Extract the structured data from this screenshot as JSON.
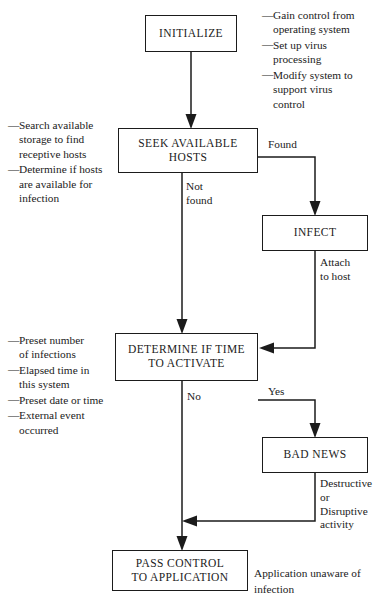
{
  "diagram": {
    "stroke_color": "#1b1b1b",
    "background_color": "#ffffff",
    "nodes": {
      "initialize": {
        "label": "INITIALIZE"
      },
      "seek": {
        "label": "SEEK AVAILABLE\nHOSTS"
      },
      "infect": {
        "label": "INFECT"
      },
      "determine": {
        "label": "DETERMINE IF TIME\nTO ACTIVATE"
      },
      "badnews": {
        "label": "BAD NEWS"
      },
      "passcontrol": {
        "label": "PASS CONTROL\nTO APPLICATION"
      }
    },
    "edge_labels": {
      "not_found": "Not\nfound",
      "found": "Found",
      "attach": "Attach\nto host",
      "no": "No",
      "yes": "Yes",
      "destructive": "Destructive\nor\nDisruptive\nactivity"
    },
    "notes": {
      "dash": "—",
      "initialize": {
        "items": [
          "Gain control from\noperating system",
          "Set up virus\nprocessing",
          "Modify system to\nsupport virus\ncontrol"
        ]
      },
      "seek": {
        "items": [
          "Search available\nstorage to find\nreceptive hosts",
          "Determine if hosts\nare available for\ninfection"
        ]
      },
      "determine": {
        "items": [
          "Preset number\nof infections",
          "Elapsed time in\nthis system",
          "Preset date or time",
          "External event\noccurred"
        ]
      },
      "application": "Application unaware of\ninfection"
    }
  }
}
